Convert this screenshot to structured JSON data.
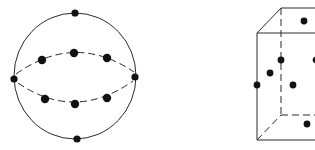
{
  "figures": [
    {
      "id": "sphere",
      "description": "Sphere with points distributed on surface: poles, equatorial points, and two latitude rings",
      "point_count": 10,
      "colors": {
        "line": "#2a2a2a",
        "point": "#111111"
      }
    },
    {
      "id": "cube",
      "description": "Cube in oblique projection with hidden edges dashed and points at face centers/edges",
      "point_count": 7,
      "colors": {
        "line": "#2a2a2a",
        "point": "#111111"
      },
      "cropped": "right side cut off"
    }
  ]
}
